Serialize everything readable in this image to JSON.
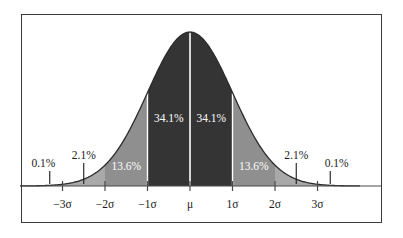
{
  "chart_data": {
    "type": "area",
    "title": "",
    "subtitle": "",
    "xlabel": "",
    "ylabel": "",
    "distribution": "normal",
    "grid": false,
    "legend": null,
    "xlim": [
      -4,
      4
    ],
    "ylim": [
      0,
      1
    ],
    "x_tick_values": [
      -3,
      -2,
      -1,
      0,
      1,
      2,
      3
    ],
    "x_tick_labels": [
      "−3σ",
      "−2σ",
      "−1σ",
      "μ",
      "1σ",
      "2σ",
      "3σ"
    ],
    "region_boundaries": [
      -3,
      -2,
      -1,
      0,
      1,
      2,
      3
    ],
    "regions": [
      {
        "name": "left-outer-tail",
        "from": -4,
        "to": -3,
        "percent": "0.1%",
        "value": 0.1,
        "shade": "light",
        "label_placement": "outside"
      },
      {
        "name": "left-two-sigma-band",
        "from": -3,
        "to": -2,
        "percent": "2.1%",
        "value": 2.1,
        "shade": "light",
        "label_placement": "outside"
      },
      {
        "name": "left-one-sigma-band",
        "from": -2,
        "to": -1,
        "percent": "13.6%",
        "value": 13.6,
        "shade": "mid",
        "label_placement": "inside"
      },
      {
        "name": "left-core",
        "from": -1,
        "to": 0,
        "percent": "34.1%",
        "value": 34.1,
        "shade": "dark",
        "label_placement": "inside"
      },
      {
        "name": "right-core",
        "from": 0,
        "to": 1,
        "percent": "34.1%",
        "value": 34.1,
        "shade": "dark",
        "label_placement": "inside"
      },
      {
        "name": "right-one-sigma-band",
        "from": 1,
        "to": 2,
        "percent": "13.6%",
        "value": 13.6,
        "shade": "mid",
        "label_placement": "inside"
      },
      {
        "name": "right-two-sigma-band",
        "from": 2,
        "to": 3,
        "percent": "2.1%",
        "value": 2.1,
        "shade": "light",
        "label_placement": "outside"
      },
      {
        "name": "right-outer-tail",
        "from": 3,
        "to": 4,
        "percent": "0.1%",
        "value": 0.1,
        "shade": "light",
        "label_placement": "outside"
      }
    ],
    "inside_labels": [
      {
        "name": "label-13-6-left",
        "text": "13.6%",
        "x": -1.5,
        "y_frac": 0.12
      },
      {
        "name": "label-34-1-left",
        "text": "34.1%",
        "x": -0.5,
        "y_frac": 0.43
      },
      {
        "name": "label-34-1-right",
        "text": "34.1%",
        "x": 0.5,
        "y_frac": 0.43
      },
      {
        "name": "label-13-6-right",
        "text": "13.6%",
        "x": 1.5,
        "y_frac": 0.12
      }
    ],
    "callouts": [
      {
        "name": "callout-0-1-left",
        "text": "0.1%",
        "leader_x": -3.3,
        "label_x": -3.45,
        "label_y_px": 164
      },
      {
        "name": "callout-2-1-left",
        "text": "2.1%",
        "leader_x": -2.5,
        "label_x": -2.5,
        "label_y_px": 156
      },
      {
        "name": "callout-2-1-right",
        "text": "2.1%",
        "leader_x": 2.5,
        "label_x": 2.5,
        "label_y_px": 156
      },
      {
        "name": "callout-0-1-right",
        "text": "0.1%",
        "leader_x": 3.3,
        "label_x": 3.45,
        "label_y_px": 164
      }
    ],
    "colors": {
      "dark": "#343434",
      "mid": "#8f8f8f",
      "light": "#a9a9a9",
      "curve": "#2b2b2b",
      "divider": "#ffffff",
      "axis": "#4a4a4a",
      "frame": "#3a3a3a",
      "background": "#ffffff",
      "inside_text": "#ffffff",
      "outside_text": "#1a1a1a"
    }
  }
}
